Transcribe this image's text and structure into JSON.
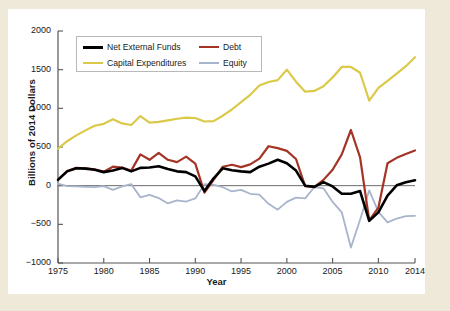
{
  "chart_data": {
    "type": "line",
    "title": "",
    "xlabel": "Year",
    "ylabel": "Billions of 2014 Dollars",
    "xlim": [
      1975,
      2014
    ],
    "ylim": [
      -1000,
      2000
    ],
    "xticks": [
      1975,
      1980,
      1985,
      1990,
      1995,
      2000,
      2005,
      2010,
      2014
    ],
    "yticks": [
      -1000,
      -500,
      0,
      500,
      1000,
      1500,
      2000
    ],
    "grid": false,
    "legend_position": "top-left",
    "zero_line": true,
    "x": [
      1975,
      1976,
      1977,
      1978,
      1979,
      1980,
      1981,
      1982,
      1983,
      1984,
      1985,
      1986,
      1987,
      1988,
      1989,
      1990,
      1991,
      1992,
      1993,
      1994,
      1995,
      1996,
      1997,
      1998,
      1999,
      2000,
      2001,
      2002,
      2003,
      2004,
      2005,
      2006,
      2007,
      2008,
      2009,
      2010,
      2011,
      2012,
      2013,
      2014
    ],
    "series": [
      {
        "name": "Net External Funds",
        "color": "#000000",
        "width": 2.6,
        "values": [
          75,
          185,
          225,
          220,
          205,
          175,
          195,
          230,
          185,
          230,
          235,
          250,
          215,
          185,
          175,
          120,
          -70,
          95,
          225,
          200,
          185,
          175,
          245,
          285,
          335,
          290,
          195,
          0,
          -15,
          45,
          -10,
          -105,
          -105,
          -70,
          -455,
          -345,
          -130,
          5,
          45,
          70
        ]
      },
      {
        "name": "Debt",
        "color": "#a33426",
        "width": 2.2,
        "values": [
          80,
          190,
          230,
          225,
          210,
          180,
          245,
          235,
          195,
          405,
          335,
          425,
          335,
          305,
          375,
          285,
          -90,
          75,
          245,
          270,
          240,
          275,
          350,
          510,
          485,
          450,
          345,
          -5,
          -20,
          75,
          205,
          405,
          720,
          365,
          -450,
          -285,
          290,
          360,
          410,
          455
        ]
      },
      {
        "name": "Capital Expenditures",
        "color": "#dbc94a",
        "width": 2.2,
        "values": [
          480,
          575,
          650,
          715,
          775,
          800,
          860,
          805,
          785,
          900,
          815,
          825,
          845,
          865,
          880,
          875,
          830,
          835,
          905,
          985,
          1080,
          1175,
          1295,
          1340,
          1365,
          1500,
          1345,
          1215,
          1225,
          1285,
          1400,
          1535,
          1535,
          1460,
          1100,
          1265,
          1355,
          1450,
          1545,
          1660
        ]
      },
      {
        "name": "Equity",
        "color": "#a8b4cc",
        "width": 1.8,
        "values": [
          25,
          -5,
          -10,
          -15,
          -20,
          -5,
          -55,
          -10,
          20,
          -150,
          -120,
          -160,
          -230,
          -190,
          -205,
          -165,
          20,
          10,
          -20,
          -75,
          -55,
          -105,
          -115,
          -235,
          -310,
          -210,
          -155,
          -165,
          -20,
          -35,
          -210,
          -345,
          -800,
          -440,
          -60,
          -340,
          -475,
          -425,
          -395,
          -390
        ]
      }
    ]
  },
  "legend": {
    "entries": [
      {
        "label": "Net External Funds",
        "color": "#000000"
      },
      {
        "label": "Debt",
        "color": "#a33426"
      },
      {
        "label": "Capital Expenditures",
        "color": "#dbc94a"
      },
      {
        "label": "Equity",
        "color": "#a8b4cc"
      }
    ]
  }
}
